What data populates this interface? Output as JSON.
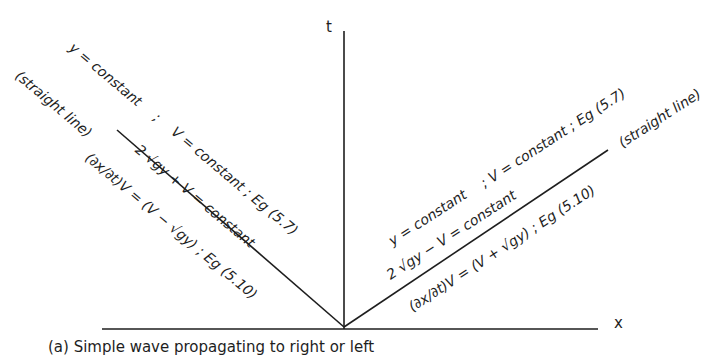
{
  "figure": {
    "axes": {
      "t_label": "t",
      "x_label": "x"
    },
    "left_characteristic": {
      "straight_line_note": "(straight line)",
      "invariant_y": "y = constant",
      "sep1": ";",
      "invariant_V": "V = constant ; Eg (5.7)",
      "riemann_invariant": "2 √gy + V = constant",
      "slope": "(∂x/∂t)V = (V − √gy) ; Eg (5.10)"
    },
    "right_characteristic": {
      "straight_line_note": "(straight line)",
      "invariant_y": "y = constant",
      "invariant_V": "; V = constant ; Eg (5.7)",
      "riemann_invariant": "2 √gy − V = constant",
      "slope": "(∂x/∂t)V = (V + √gy) ; Eg (5.10)"
    },
    "caption": "(a) Simple wave propagating to right or left"
  }
}
